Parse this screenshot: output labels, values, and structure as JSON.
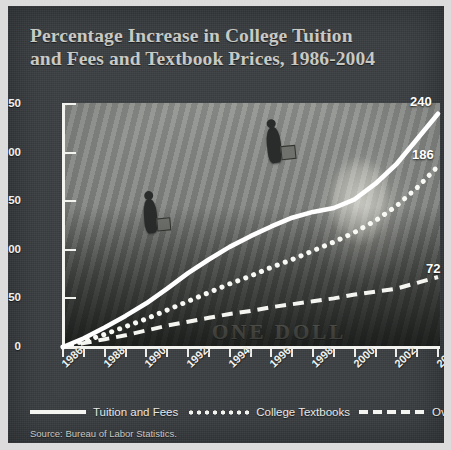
{
  "title": {
    "line1": "Percentage Increase in College Tuition",
    "line2": "and Fees and Textbook Prices, 1986-2004"
  },
  "source": "Source: Bureau of Labor Statistics.",
  "legend": [
    {
      "label": "Tuition and Fees",
      "style": "solid"
    },
    {
      "label": "College Textbooks",
      "style": "dotted"
    },
    {
      "label": "Overall Prices",
      "style": "dashed"
    }
  ],
  "end_labels": {
    "tuition": "240",
    "textbooks": "186",
    "overall": "72"
  },
  "colors": {
    "panel": "#3b3f42",
    "ink": "#f2f2ee",
    "title": "#c9c9c4",
    "border": "#dcdcdc"
  },
  "chart_data": {
    "type": "line",
    "title": "Percentage Increase in College Tuition and Fees and Textbook Prices, 1986-2004",
    "xlabel": "",
    "ylabel": "",
    "xlim": [
      1986,
      2004
    ],
    "ylim": [
      0,
      250
    ],
    "yticks": [
      0,
      50,
      100,
      150,
      200,
      250
    ],
    "xticks": [
      1986,
      1988,
      1990,
      1992,
      1994,
      1996,
      1998,
      2000,
      2002,
      2004
    ],
    "xtick_labels": [
      "1986",
      "1988",
      "1990",
      "1992",
      "1994",
      "1996",
      "1998",
      "2000",
      "2002",
      "2004"
    ],
    "grid": false,
    "legend_position": "bottom",
    "x": [
      1986,
      1987,
      1988,
      1989,
      1990,
      1991,
      1992,
      1993,
      1994,
      1995,
      1996,
      1997,
      1998,
      1999,
      2000,
      2001,
      2002,
      2003,
      2004
    ],
    "series": [
      {
        "name": "Tuition and Fees",
        "style": "solid",
        "end_value": 240,
        "values": [
          0,
          9,
          20,
          32,
          45,
          60,
          76,
          90,
          103,
          114,
          124,
          133,
          139,
          143,
          152,
          168,
          188,
          214,
          240
        ]
      },
      {
        "name": "College Textbooks",
        "style": "dotted",
        "end_value": 186,
        "values": [
          0,
          6,
          13,
          21,
          29,
          38,
          47,
          56,
          65,
          73,
          82,
          90,
          99,
          108,
          118,
          130,
          145,
          164,
          186
        ]
      },
      {
        "name": "Overall Prices",
        "style": "dashed",
        "end_value": 72,
        "values": [
          0,
          4,
          8,
          12,
          17,
          22,
          26,
          30,
          34,
          37,
          41,
          44,
          47,
          50,
          54,
          57,
          60,
          66,
          72
        ]
      }
    ]
  }
}
